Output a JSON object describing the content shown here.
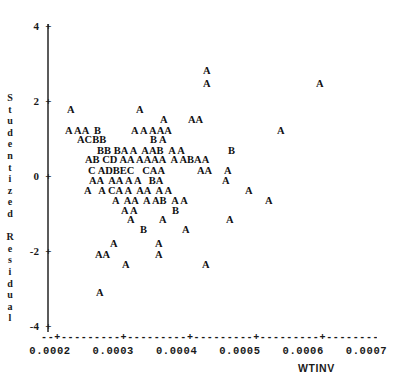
{
  "chart_data": {
    "type": "scatter",
    "title": "",
    "xlabel": "WTINV",
    "ylabel": "Studentized Residual",
    "xlim": [
      0.00017,
      0.00072
    ],
    "ylim": [
      -4.4,
      4.4
    ],
    "grid": false,
    "legend": null,
    "note": "SAS-style character scatter plot. Plot symbol letters encode the number of coincident observations: A=1, B=2, C=3, D=4.",
    "symbol_legend": {
      "A": 1,
      "B": 2,
      "C": 3,
      "D": 4
    },
    "x_ticks": [
      {
        "value": 0.0002,
        "label": "0.0002"
      },
      {
        "value": 0.0003,
        "label": "0.0003"
      },
      {
        "value": 0.0004,
        "label": "0.0004"
      },
      {
        "value": 0.0005,
        "label": "0.0005"
      },
      {
        "value": 0.0006,
        "label": "0.0006"
      },
      {
        "value": 0.0007,
        "label": "0.0007"
      }
    ],
    "y_ticks": [
      {
        "value": 4,
        "label": "4"
      },
      {
        "value": 2,
        "label": "2"
      },
      {
        "value": 0,
        "label": "0"
      },
      {
        "value": -2,
        "label": "-2"
      },
      {
        "value": -4,
        "label": "-4"
      }
    ],
    "y_axis_chars": [
      "S",
      "t",
      "u",
      "d",
      "e",
      "n",
      "t",
      "i",
      "z",
      "e",
      "d",
      "",
      "R",
      "e",
      "s",
      "i",
      "d",
      "u",
      "a",
      "l"
    ],
    "x_axis_rule": "--+---------+---------+---------+---------+---------+--",
    "points": [
      {
        "symbol": "A",
        "x": 0.000402,
        "y": 2.79,
        "count": 1
      },
      {
        "symbol": "A",
        "x": 0.000402,
        "y": 2.45,
        "count": 1
      },
      {
        "symbol": "A",
        "x": 0.00058,
        "y": 2.45,
        "count": 1
      },
      {
        "symbol": "A",
        "x": 0.000228,
        "y": 1.75,
        "count": 1
      },
      {
        "symbol": "A",
        "x": 0.000325,
        "y": 1.75,
        "count": 1
      },
      {
        "symbol": "A",
        "x": 0.000349,
        "y": 1.48,
        "count": 1
      },
      {
        "symbol": "A",
        "x": 0.000386,
        "y": 1.48,
        "count": 1
      },
      {
        "symbol": "A",
        "x": 0.000394,
        "y": 1.48,
        "count": 1
      },
      {
        "symbol": "A",
        "x": 0.000226,
        "y": 1.2,
        "count": 1
      },
      {
        "symbol": "A",
        "x": 0.000242,
        "y": 1.2,
        "count": 1
      },
      {
        "symbol": "A",
        "x": 0.00025,
        "y": 1.2,
        "count": 1
      },
      {
        "symbol": "B",
        "x": 0.000272,
        "y": 1.2,
        "count": 2
      },
      {
        "symbol": "A",
        "x": 0.000314,
        "y": 1.2,
        "count": 1
      },
      {
        "symbol": "A",
        "x": 0.000334,
        "y": 1.2,
        "count": 1
      },
      {
        "symbol": "A",
        "x": 0.00035,
        "y": 1.2,
        "count": 1
      },
      {
        "symbol": "A",
        "x": 0.000358,
        "y": 1.2,
        "count": 1
      },
      {
        "symbol": "A",
        "x": 0.000366,
        "y": 1.2,
        "count": 1
      },
      {
        "symbol": "A",
        "x": 0.000555,
        "y": 1.2,
        "count": 1
      },
      {
        "symbol": "A",
        "x": 0.00024,
        "y": 0.95,
        "count": 1
      },
      {
        "symbol": "C",
        "x": 0.000248,
        "y": 0.95,
        "count": 3
      },
      {
        "symbol": "B",
        "x": 0.000256,
        "y": 0.95,
        "count": 2
      },
      {
        "symbol": "B",
        "x": 0.000264,
        "y": 0.95,
        "count": 2
      },
      {
        "symbol": "B",
        "x": 0.000343,
        "y": 0.95,
        "count": 2
      },
      {
        "symbol": "A",
        "x": 0.000359,
        "y": 0.95,
        "count": 1
      },
      {
        "symbol": "B",
        "x": 0.000262,
        "y": 0.67,
        "count": 2
      },
      {
        "symbol": "B",
        "x": 0.00027,
        "y": 0.67,
        "count": 2
      },
      {
        "symbol": "B",
        "x": 0.00029,
        "y": 0.67,
        "count": 2
      },
      {
        "symbol": "A",
        "x": 0.000298,
        "y": 0.67,
        "count": 1
      },
      {
        "symbol": "A",
        "x": 0.000315,
        "y": 0.67,
        "count": 1
      },
      {
        "symbol": "A",
        "x": 0.000348,
        "y": 0.67,
        "count": 1
      },
      {
        "symbol": "A",
        "x": 0.000356,
        "y": 0.67,
        "count": 1
      },
      {
        "symbol": "B",
        "x": 0.000364,
        "y": 0.67,
        "count": 2
      },
      {
        "symbol": "A",
        "x": 0.000399,
        "y": 0.67,
        "count": 1
      },
      {
        "symbol": "A",
        "x": 0.000419,
        "y": 0.67,
        "count": 1
      },
      {
        "symbol": "B",
        "x": 0.000468,
        "y": 0.67,
        "count": 2
      },
      {
        "symbol": "A",
        "x": 0.000248,
        "y": 0.42,
        "count": 1
      },
      {
        "symbol": "B",
        "x": 0.000256,
        "y": 0.42,
        "count": 2
      },
      {
        "symbol": "C",
        "x": 0.000275,
        "y": 0.42,
        "count": 3
      },
      {
        "symbol": "D",
        "x": 0.000283,
        "y": 0.42,
        "count": 4
      },
      {
        "symbol": "A",
        "x": 0.0003,
        "y": 0.42,
        "count": 1
      },
      {
        "symbol": "A",
        "x": 0.000308,
        "y": 0.42,
        "count": 1
      },
      {
        "symbol": "A",
        "x": 0.000325,
        "y": 0.42,
        "count": 1
      },
      {
        "symbol": "A",
        "x": 0.000333,
        "y": 0.42,
        "count": 1
      },
      {
        "symbol": "A",
        "x": 0.000341,
        "y": 0.42,
        "count": 1
      },
      {
        "symbol": "A",
        "x": 0.000349,
        "y": 0.42,
        "count": 1
      },
      {
        "symbol": "A",
        "x": 0.000374,
        "y": 0.42,
        "count": 1
      },
      {
        "symbol": "A",
        "x": 0.000391,
        "y": 0.42,
        "count": 1
      },
      {
        "symbol": "B",
        "x": 0.000399,
        "y": 0.42,
        "count": 2
      },
      {
        "symbol": "A",
        "x": 0.000407,
        "y": 0.42,
        "count": 1
      },
      {
        "symbol": "A",
        "x": 0.000415,
        "y": 0.42,
        "count": 1
      },
      {
        "symbol": "C",
        "x": 0.000257,
        "y": 0.14,
        "count": 3
      },
      {
        "symbol": "A",
        "x": 0.000278,
        "y": 0.14,
        "count": 1
      },
      {
        "symbol": "D",
        "x": 0.000286,
        "y": 0.14,
        "count": 4
      },
      {
        "symbol": "B",
        "x": 0.000294,
        "y": 0.14,
        "count": 2
      },
      {
        "symbol": "E",
        "x": 0.000302,
        "y": 0.14,
        "count": 5
      },
      {
        "symbol": "C",
        "x": 0.00033,
        "y": 0.14,
        "count": 3
      },
      {
        "symbol": "A",
        "x": 0.000338,
        "y": 0.14,
        "count": 1
      },
      {
        "symbol": "A",
        "x": 0.000346,
        "y": 0.14,
        "count": 1
      },
      {
        "symbol": "A",
        "x": 0.000399,
        "y": 0.14,
        "count": 1
      },
      {
        "symbol": "A",
        "x": 0.000407,
        "y": 0.14,
        "count": 1
      },
      {
        "symbol": "A",
        "x": 0.000449,
        "y": 0.14,
        "count": 1
      },
      {
        "symbol": "A",
        "x": 0.000253,
        "y": -0.12,
        "count": 1
      },
      {
        "symbol": "A",
        "x": 0.000261,
        "y": -0.12,
        "count": 1
      },
      {
        "symbol": "A",
        "x": 0.000288,
        "y": -0.12,
        "count": 1
      },
      {
        "symbol": "A",
        "x": 0.000296,
        "y": -0.12,
        "count": 1
      },
      {
        "symbol": "A",
        "x": 0.000312,
        "y": -0.12,
        "count": 1
      },
      {
        "symbol": "A",
        "x": 0.000329,
        "y": -0.12,
        "count": 1
      },
      {
        "symbol": "B",
        "x": 0.000363,
        "y": -0.12,
        "count": 2
      },
      {
        "symbol": "A",
        "x": 0.000371,
        "y": -0.12,
        "count": 1
      },
      {
        "symbol": "A",
        "x": 0.000446,
        "y": -0.12,
        "count": 1
      },
      {
        "symbol": "A",
        "x": 0.000239,
        "y": -0.4,
        "count": 1
      },
      {
        "symbol": "A",
        "x": 0.000277,
        "y": -0.4,
        "count": 1
      },
      {
        "symbol": "C",
        "x": 0.000293,
        "y": -0.4,
        "count": 3
      },
      {
        "symbol": "A",
        "x": 0.000301,
        "y": -0.4,
        "count": 1
      },
      {
        "symbol": "A",
        "x": 0.000317,
        "y": -0.4,
        "count": 1
      },
      {
        "symbol": "A",
        "x": 0.000341,
        "y": -0.4,
        "count": 1
      },
      {
        "symbol": "A",
        "x": 0.000349,
        "y": -0.4,
        "count": 1
      },
      {
        "symbol": "A",
        "x": 0.000374,
        "y": -0.4,
        "count": 1
      },
      {
        "symbol": "A",
        "x": 0.00039,
        "y": -0.4,
        "count": 1
      },
      {
        "symbol": "A",
        "x": 0.000478,
        "y": -0.4,
        "count": 1
      },
      {
        "symbol": "A",
        "x": 0.000291,
        "y": -0.66,
        "count": 1
      },
      {
        "symbol": "A",
        "x": 0.000315,
        "y": -0.66,
        "count": 1
      },
      {
        "symbol": "A",
        "x": 0.000323,
        "y": -0.66,
        "count": 1
      },
      {
        "symbol": "A",
        "x": 0.000347,
        "y": -0.66,
        "count": 1
      },
      {
        "symbol": "A",
        "x": 0.000363,
        "y": -0.66,
        "count": 1
      },
      {
        "symbol": "B",
        "x": 0.000371,
        "y": -0.66,
        "count": 2
      },
      {
        "symbol": "A",
        "x": 0.000395,
        "y": -0.66,
        "count": 1
      },
      {
        "symbol": "A",
        "x": 0.000411,
        "y": -0.66,
        "count": 1
      },
      {
        "symbol": "A",
        "x": 0.000512,
        "y": -0.66,
        "count": 1
      },
      {
        "symbol": "A",
        "x": 0.000302,
        "y": -0.92,
        "count": 1
      },
      {
        "symbol": "A",
        "x": 0.000314,
        "y": -0.92,
        "count": 1
      },
      {
        "symbol": "B",
        "x": 0.000366,
        "y": -0.92,
        "count": 2
      },
      {
        "symbol": "A",
        "x": 0.000311,
        "y": -1.18,
        "count": 1
      },
      {
        "symbol": "A",
        "x": 0.000349,
        "y": -1.18,
        "count": 1
      },
      {
        "symbol": "A",
        "x": 0.000442,
        "y": -1.18,
        "count": 1
      },
      {
        "symbol": "B",
        "x": 0.000325,
        "y": -1.44,
        "count": 2
      },
      {
        "symbol": "A",
        "x": 0.000372,
        "y": -1.44,
        "count": 1
      },
      {
        "symbol": "A",
        "x": 0.000281,
        "y": -1.82,
        "count": 1
      },
      {
        "symbol": "A",
        "x": 0.000347,
        "y": -1.82,
        "count": 1
      },
      {
        "symbol": "A",
        "x": 0.000264,
        "y": -2.1,
        "count": 1
      },
      {
        "symbol": "A",
        "x": 0.000272,
        "y": -2.1,
        "count": 1
      },
      {
        "symbol": "A",
        "x": 0.000347,
        "y": -2.1,
        "count": 1
      },
      {
        "symbol": "A",
        "x": 0.000292,
        "y": -2.37,
        "count": 1
      },
      {
        "symbol": "A",
        "x": 0.000404,
        "y": -2.37,
        "count": 1
      },
      {
        "symbol": "A",
        "x": 0.000263,
        "y": -3.1,
        "count": 1
      }
    ],
    "rows": [
      {
        "y": 2.79,
        "text": "A",
        "left_px": 203
      },
      {
        "y": 2.45,
        "text": "A",
        "left_px": 203
      },
      {
        "y": 2.45,
        "text": "A",
        "left_px": 316
      },
      {
        "y": 1.75,
        "text": "A",
        "left_px": 67
      },
      {
        "y": 1.75,
        "text": "A",
        "left_px": 136
      },
      {
        "y": 1.48,
        "text": "A",
        "left_px": 160
      },
      {
        "y": 1.48,
        "text": "AA",
        "left_px": 188
      },
      {
        "y": 1.2,
        "text": "A AA  B",
        "left_px": 65
      },
      {
        "y": 1.2,
        "text": "A A AAA",
        "left_px": 131
      },
      {
        "y": 1.2,
        "text": "A",
        "left_px": 277
      },
      {
        "y": 0.95,
        "text": "ACBB",
        "left_px": 77
      },
      {
        "y": 0.95,
        "text": "B A",
        "left_px": 150
      },
      {
        "y": 0.67,
        "text": "BB BA A  AAB  A A",
        "left_px": 97
      },
      {
        "y": 0.67,
        "text": "B",
        "left_px": 228
      },
      {
        "y": 0.42,
        "text": "AB CD AA AAAA  A ABAA",
        "left_px": 85
      },
      {
        "y": 0.14,
        "text": "C ADBEC   CAA",
        "left_px": 88
      },
      {
        "y": 0.14,
        "text": "AA",
        "left_px": 197
      },
      {
        "y": 0.14,
        "text": "A",
        "left_px": 224
      },
      {
        "y": -0.12,
        "text": "AA  AA A A   BA",
        "left_px": 89
      },
      {
        "y": -0.12,
        "text": "A",
        "left_px": 222
      },
      {
        "y": -0.4,
        "text": "A   A CA A  AA  A A",
        "left_px": 84
      },
      {
        "y": -0.4,
        "text": "A",
        "left_px": 245
      },
      {
        "y": -0.66,
        "text": "A  AA  A AB  A A",
        "left_px": 112
      },
      {
        "y": -0.66,
        "text": "A",
        "left_px": 265
      },
      {
        "y": -0.92,
        "text": "A A",
        "left_px": 121
      },
      {
        "y": -0.92,
        "text": "B",
        "left_px": 172
      },
      {
        "y": -1.18,
        "text": "A",
        "left_px": 127
      },
      {
        "y": -1.18,
        "text": "A",
        "left_px": 159
      },
      {
        "y": -1.18,
        "text": "A",
        "left_px": 226
      },
      {
        "y": -1.44,
        "text": "B",
        "left_px": 140
      },
      {
        "y": -1.44,
        "text": "A",
        "left_px": 182
      },
      {
        "y": -1.82,
        "text": "A",
        "left_px": 110
      },
      {
        "y": -1.82,
        "text": "A",
        "left_px": 155
      },
      {
        "y": -2.1,
        "text": "AA",
        "left_px": 95
      },
      {
        "y": -2.1,
        "text": "A",
        "left_px": 155
      },
      {
        "y": -2.37,
        "text": "A",
        "left_px": 122
      },
      {
        "y": -2.37,
        "text": "A",
        "left_px": 202
      },
      {
        "y": -3.1,
        "text": "A",
        "left_px": 96
      }
    ]
  }
}
